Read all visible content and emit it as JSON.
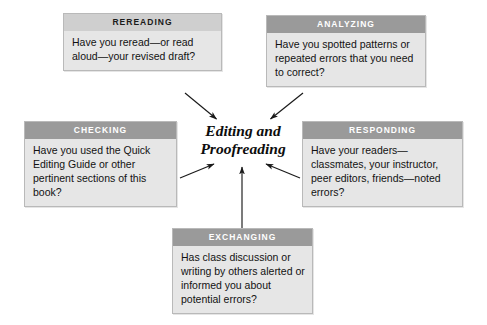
{
  "diagram": {
    "center": {
      "title": "Editing and\nProofreading"
    },
    "nodes": [
      {
        "key": "rereading",
        "header": "REREADING",
        "body": "Have you reread—or read aloud—your revised draft?",
        "header_style": "light",
        "header_bg": "#cfcfcf",
        "header_color": "#1a1a1a"
      },
      {
        "key": "analyzing",
        "header": "ANALYZING",
        "body": "Have you spotted patterns or repeated errors that you need to correct?",
        "header_style": "dark",
        "header_bg": "#9a9a9a",
        "header_color": "#ffffff"
      },
      {
        "key": "checking",
        "header": "CHECKING",
        "body": "Have you used the Quick Editing Guide or other pertinent sections of this book?",
        "header_style": "dark",
        "header_bg": "#9a9a9a",
        "header_color": "#ffffff"
      },
      {
        "key": "responding",
        "header": "RESPONDING",
        "body": "Have your readers—classmates, your instructor, peer editors, friends—noted errors?",
        "header_style": "dark",
        "header_bg": "#9a9a9a",
        "header_color": "#ffffff"
      },
      {
        "key": "exchanging",
        "header": "EXCHANGING",
        "body": "Has class discussion or writing by others alerted or informed you about potential errors?",
        "header_style": "dark",
        "header_bg": "#9a9a9a",
        "header_color": "#ffffff"
      }
    ],
    "arrows": [
      {
        "name": "arrow-rereading-to-center",
        "from": "rereading",
        "to": "center"
      },
      {
        "name": "arrow-analyzing-to-center",
        "from": "analyzing",
        "to": "center"
      },
      {
        "name": "arrow-checking-to-center",
        "from": "checking",
        "to": "center"
      },
      {
        "name": "arrow-responding-to-center",
        "from": "responding",
        "to": "center"
      },
      {
        "name": "arrow-exchanging-to-center",
        "from": "exchanging",
        "to": "center"
      }
    ],
    "colors": {
      "body_bg": "#e6e6e6",
      "border": "#b9b9b9",
      "arrow": "#1a1a1a",
      "page_bg": "#ffffff"
    }
  }
}
